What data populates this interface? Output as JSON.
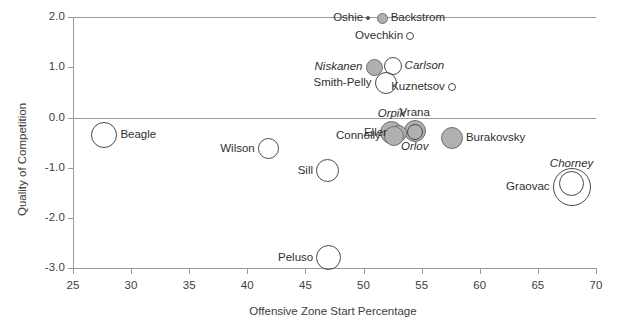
{
  "chart_data": {
    "type": "scatter",
    "title": "",
    "xlabel": "Offensive Zone Start Percentage",
    "ylabel": "Quality of Competition",
    "xlim": [
      25,
      70
    ],
    "ylim": [
      -3.0,
      2.0
    ],
    "xticks": [
      "25",
      "30",
      "35",
      "40",
      "45",
      "50",
      "55",
      "60",
      "65",
      "70"
    ],
    "xtick_values": [
      25,
      30,
      35,
      40,
      45,
      50,
      55,
      60,
      65,
      70
    ],
    "yticks": [
      "2.0",
      "1.0",
      "0.0",
      "-1.0",
      "-2.0",
      "-3.0"
    ],
    "ytick_values": [
      2.0,
      1.0,
      0.0,
      -1.0,
      -2.0,
      -3.0
    ],
    "grid": false,
    "zero_line": true,
    "legend": "none",
    "size_encoding": "bubble-size",
    "marker_fills": {
      "filled": "#b0b0b0",
      "open": "#ffffff",
      "edge": "#4a4a4a"
    },
    "points": [
      {
        "name": "Oshie",
        "x": 50.4,
        "y": 1.98,
        "size": 4,
        "style": "dot",
        "label_side": "left",
        "italic": false
      },
      {
        "name": "Backstrom",
        "x": 51.6,
        "y": 1.98,
        "size": 11,
        "style": "filled",
        "label_side": "right",
        "italic": false
      },
      {
        "name": "Ovechkin",
        "x": 54.0,
        "y": 1.62,
        "size": 8,
        "style": "open",
        "label_side": "left",
        "italic": false
      },
      {
        "name": "Niskanen",
        "x": 50.9,
        "y": 1.0,
        "size": 17,
        "style": "filled",
        "label_side": "left",
        "italic": true
      },
      {
        "name": "Carlson",
        "x": 52.5,
        "y": 1.02,
        "size": 18,
        "style": "open",
        "label_side": "right",
        "italic": true
      },
      {
        "name": "Smith-Pelly",
        "x": 51.9,
        "y": 0.68,
        "size": 22,
        "style": "open",
        "label_side": "left",
        "italic": false
      },
      {
        "name": "Kuznetsov",
        "x": 57.6,
        "y": 0.6,
        "size": 8,
        "style": "open",
        "label_side": "left",
        "italic": false
      },
      {
        "name": "Vrana",
        "x": 54.4,
        "y": -0.28,
        "size": 22,
        "style": "filled",
        "label_side": "above",
        "italic": false
      },
      {
        "name": "Orpik",
        "x": 52.4,
        "y": -0.3,
        "size": 23,
        "style": "filled",
        "label_side": "above",
        "italic": true
      },
      {
        "name": "Eller",
        "x": 53.0,
        "y": -0.32,
        "size": 17,
        "style": "filled",
        "label_side": "left",
        "italic": false
      },
      {
        "name": "Connolly",
        "x": 52.6,
        "y": -0.38,
        "size": 20,
        "style": "filled",
        "label_side": "left",
        "italic": false
      },
      {
        "name": "Orlov",
        "x": 54.4,
        "y": -0.3,
        "size": 16,
        "style": "open",
        "label_side": "below",
        "italic": true
      },
      {
        "name": "Burakovsky",
        "x": 57.6,
        "y": -0.42,
        "size": 22,
        "style": "filled",
        "label_side": "right",
        "italic": false
      },
      {
        "name": "Beagle",
        "x": 27.7,
        "y": -0.35,
        "size": 26,
        "style": "open",
        "label_side": "right",
        "italic": false
      },
      {
        "name": "Wilson",
        "x": 41.8,
        "y": -0.62,
        "size": 21,
        "style": "open",
        "label_side": "left",
        "italic": false
      },
      {
        "name": "Sill",
        "x": 46.9,
        "y": -1.06,
        "size": 23,
        "style": "open",
        "label_side": "left",
        "italic": false
      },
      {
        "name": "Graovac",
        "x": 67.9,
        "y": -1.38,
        "size": 38,
        "style": "open",
        "label_side": "left",
        "italic": false
      },
      {
        "name": "Chorney",
        "x": 67.9,
        "y": -1.32,
        "size": 25,
        "style": "open",
        "label_side": "above",
        "italic": true
      },
      {
        "name": "Peluso",
        "x": 47.0,
        "y": -2.8,
        "size": 25,
        "style": "open",
        "label_side": "left",
        "italic": false
      }
    ]
  }
}
